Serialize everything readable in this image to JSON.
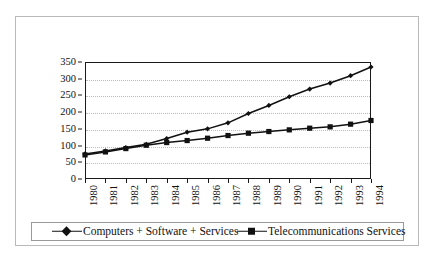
{
  "chart_data": {
    "type": "line",
    "title": "",
    "xlabel": "",
    "ylabel": "",
    "categories": [
      "1980",
      "1981",
      "1982",
      "1983",
      "1984",
      "1985",
      "1986",
      "1987",
      "1988",
      "1989",
      "1990",
      "1991",
      "1992",
      "1993",
      "1994"
    ],
    "ylim": [
      0,
      350
    ],
    "y_ticks": [
      0,
      50,
      100,
      150,
      200,
      250,
      300,
      350
    ],
    "grid": true,
    "legend_position": "bottom",
    "series": [
      {
        "name": "Computers + Software + Services",
        "marker": "diamond",
        "color": "#111111",
        "values": [
          75,
          84,
          94,
          104,
          121,
          140,
          150,
          168,
          196,
          220,
          246,
          269,
          287,
          309,
          335
        ]
      },
      {
        "name": "Telecommunications Services",
        "marker": "square",
        "color": "#111111",
        "values": [
          72,
          81,
          91,
          101,
          109,
          115,
          122,
          130,
          137,
          142,
          147,
          152,
          156,
          164,
          175
        ]
      }
    ]
  },
  "legend": {
    "entries": [
      {
        "label": "Computers + Software + Services",
        "marker": "diamond"
      },
      {
        "label": "Telecommunications Services",
        "marker": "square"
      }
    ]
  },
  "colors": {
    "series": "#111111",
    "axis": "#1a1a1a",
    "gridline": "#bdbdbd",
    "frame": "#b9b9b9",
    "background": "#ffffff"
  }
}
